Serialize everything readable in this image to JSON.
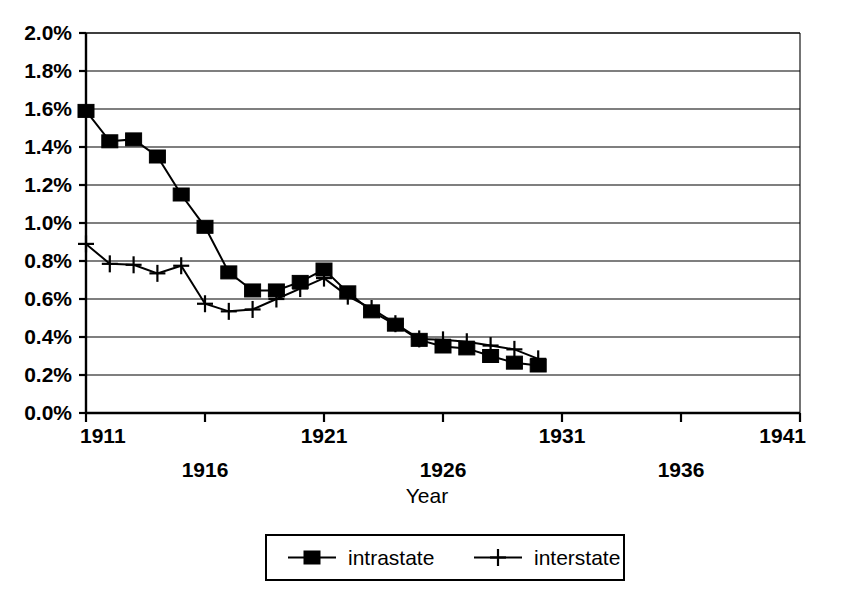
{
  "chart_data": {
    "type": "line",
    "title": "",
    "xlabel": "Year",
    "ylabel": "",
    "xlim": [
      1911,
      1941
    ],
    "ylim": [
      0.0,
      2.0
    ],
    "y_tick_format": "percent",
    "grid": true,
    "legend_position": "bottom",
    "x_ticks": [
      1911,
      1916,
      1921,
      1926,
      1931,
      1936,
      1941
    ],
    "x_tick_labels": [
      "1911",
      "1916",
      "1921",
      "1926",
      "1931",
      "1936",
      "1941"
    ],
    "y_ticks": [
      0.0,
      0.2,
      0.4,
      0.6,
      0.8,
      1.0,
      1.2,
      1.4,
      1.6,
      1.8,
      2.0
    ],
    "y_tick_labels": [
      "0.0%",
      "0.2%",
      "0.4%",
      "0.6%",
      "0.8%",
      "1.0%",
      "1.2%",
      "1.4%",
      "1.6%",
      "1.8%",
      "2.0%"
    ],
    "x": [
      1911,
      1912,
      1913,
      1914,
      1915,
      1916,
      1917,
      1918,
      1919,
      1920,
      1921,
      1922,
      1923,
      1924,
      1925,
      1926,
      1927,
      1928,
      1929,
      1930
    ],
    "series": [
      {
        "name": "intrastate",
        "marker": "square",
        "color": "#000000",
        "values": [
          1.59,
          1.43,
          1.44,
          1.35,
          1.15,
          0.98,
          0.74,
          0.645,
          0.645,
          0.69,
          0.755,
          0.635,
          0.535,
          0.465,
          0.385,
          0.35,
          0.34,
          0.3,
          0.265,
          0.25
        ]
      },
      {
        "name": "interstate",
        "marker": "plus",
        "color": "#000000",
        "values": [
          0.89,
          0.785,
          0.78,
          0.735,
          0.775,
          0.575,
          0.535,
          0.545,
          0.6,
          0.655,
          0.71,
          0.615,
          0.55,
          0.47,
          0.39,
          0.385,
          0.375,
          0.355,
          0.335,
          0.285
        ]
      }
    ]
  },
  "legend": {
    "entries": [
      {
        "label": "intrastate",
        "marker": "square"
      },
      {
        "label": "interstate",
        "marker": "plus"
      }
    ]
  },
  "axis": {
    "x_title": "Year"
  }
}
